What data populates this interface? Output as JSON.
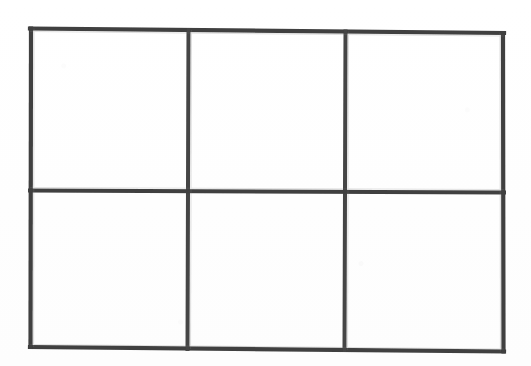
{
  "document": {
    "kind": "scanned-blank-grid",
    "background_color": "#ffffff",
    "width": 531,
    "height": 366,
    "visible_text": "",
    "note": ""
  },
  "grid": {
    "name": "blank-table-grid",
    "rows": 2,
    "columns": 3,
    "cell_count": 6,
    "line_color": "#3f3f3f",
    "line_color_light": "#5a5a5a",
    "line_width_px": 4,
    "outer": {
      "left_x": 30,
      "right_x": 504,
      "top_y_left": 28,
      "top_y_right": 33,
      "bottom_y_left": 347,
      "bottom_y_right": 352
    },
    "vertical_dividers_x": [
      188,
      345
    ],
    "horizontal_dividers_y": [
      191
    ],
    "rotation_deg": 0.6,
    "cells": [
      {
        "id": "r1c1",
        "row": 1,
        "column": 1,
        "text": ""
      },
      {
        "id": "r1c2",
        "row": 1,
        "column": 2,
        "text": ""
      },
      {
        "id": "r1c3",
        "row": 1,
        "column": 3,
        "text": ""
      },
      {
        "id": "r2c1",
        "row": 2,
        "column": 1,
        "text": ""
      },
      {
        "id": "r2c2",
        "row": 2,
        "column": 2,
        "text": ""
      },
      {
        "id": "r2c3",
        "row": 2,
        "column": 3,
        "text": ""
      }
    ]
  }
}
